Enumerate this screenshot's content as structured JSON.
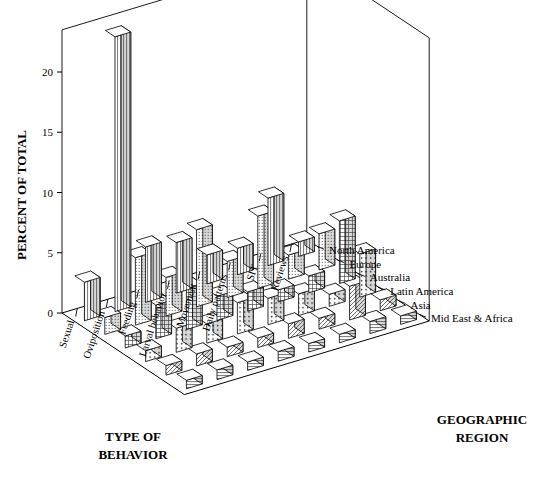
{
  "chart_data": {
    "type": "bar",
    "render": "3d-grouped-bar",
    "title": "",
    "xlabel": "TYPE OF BEHAVIOR",
    "ylabel": "PERCENT OF TOTAL",
    "zlabel": "GEOGRAPHIC REGION",
    "ylim": [
      0,
      23.5
    ],
    "yticks": [
      0,
      5,
      10,
      15,
      20
    ],
    "ytick_labels": [
      "0",
      "5",
      "10",
      "15",
      "20"
    ],
    "grid": false,
    "legend": "none",
    "categories": [
      "Sexual",
      "Oviposition",
      "Feeding",
      "Larval behavior",
      "Movement",
      "Daily patterns",
      "SIT",
      "Reviews"
    ],
    "series": [
      {
        "name": "North America",
        "pattern": "vertical-lines",
        "values": [
          3.2,
          22.8,
          4.6,
          4.2,
          2.4,
          2.2,
          5.6,
          1.2
        ]
      },
      {
        "name": "Europe",
        "pattern": "fine-dots",
        "values": [
          1.4,
          5.6,
          3.2,
          6.4,
          3.0,
          6.0,
          2.0,
          3.0
        ]
      },
      {
        "name": "Australia",
        "pattern": "grid-cross",
        "values": [
          1.0,
          2.8,
          3.4,
          2.0,
          1.6,
          1.0,
          1.4,
          5.2
        ]
      },
      {
        "name": "Latin America",
        "pattern": "coarse-dots",
        "values": [
          0.9,
          2.0,
          1.6,
          2.6,
          2.2,
          1.8,
          1.0,
          3.6
        ]
      },
      {
        "name": "Asia",
        "pattern": "diagonal-hatch",
        "values": [
          0.8,
          1.0,
          0.8,
          0.8,
          1.2,
          0.9,
          2.8,
          0.9
        ]
      },
      {
        "name": "Mid East & Africa",
        "pattern": "horizontal-lines",
        "values": [
          0.7,
          0.8,
          0.7,
          0.8,
          0.7,
          0.7,
          1.0,
          0.7
        ]
      }
    ]
  },
  "axes": {
    "y_title": "PERCENT OF TOTAL",
    "x_title_line1": "TYPE OF",
    "x_title_line2": "BEHAVIOR",
    "z_title_line1": "GEOGRAPHIC",
    "z_title_line2": "REGION"
  }
}
